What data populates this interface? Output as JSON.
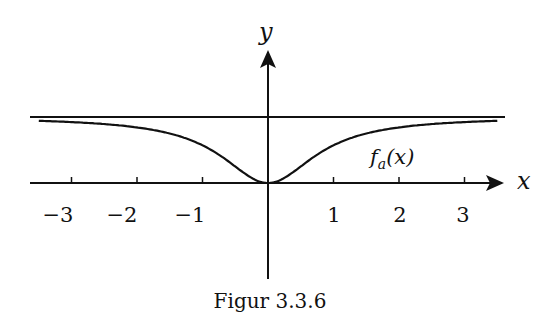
{
  "figure": {
    "caption": "Figur 3.3.6",
    "x_axis_label": "x",
    "y_axis_label": "y",
    "curve_label": "f",
    "curve_label_sub": "a",
    "curve_label_arg": "(x)",
    "x_ticks": [
      "−3",
      "−2",
      "−1",
      "1",
      "2",
      "3"
    ]
  },
  "chart_data": {
    "type": "line",
    "title": "Figur 3.3.6",
    "xlabel": "x",
    "ylabel": "y",
    "xlim": [
      -3.5,
      3.5
    ],
    "ylim": [
      -1.4,
      1.25
    ],
    "x_ticks": [
      -3,
      -2,
      -1,
      1,
      2,
      3
    ],
    "grid": false,
    "legend": "none",
    "series": [
      {
        "name": "f_a(x)",
        "x": [
          -3.5,
          -3,
          -2,
          -1,
          -0.5,
          0,
          0.5,
          1,
          2,
          3,
          3.5
        ],
        "values": [
          0.94,
          0.92,
          0.84,
          0.57,
          0.25,
          0,
          0.25,
          0.57,
          0.84,
          0.92,
          0.94
        ]
      },
      {
        "name": "asymptote y=1",
        "x": [
          -3.5,
          3.5
        ],
        "values": [
          1,
          1
        ]
      }
    ],
    "annotations": [
      "f_a(x)"
    ]
  }
}
